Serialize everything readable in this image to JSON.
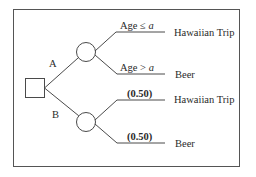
{
  "diagram": {
    "type": "decision-tree",
    "decision_node": {
      "label": "decision"
    },
    "branches": [
      {
        "label": "A",
        "outcomes": [
          {
            "condition_prefix": "Age ≤ ",
            "condition_var": "a",
            "result": "Hawaiian Trip"
          },
          {
            "condition_prefix": "Age > ",
            "condition_var": "a",
            "result": "Beer"
          }
        ]
      },
      {
        "label": "B",
        "outcomes": [
          {
            "probability": "(0.50)",
            "result": "Hawaiian Trip"
          },
          {
            "probability": "(0.50)",
            "result": "Beer"
          }
        ]
      }
    ]
  },
  "colors": {
    "line": "#4a4a4a",
    "text": "#2a2a2a",
    "frame": "#555555",
    "background": "#ffffff"
  }
}
